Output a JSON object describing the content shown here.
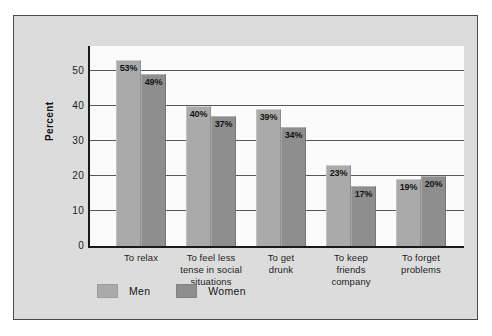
{
  "chart_data": {
    "type": "bar",
    "title": "",
    "subtitle": "",
    "xlabel": "",
    "ylabel": "Percent",
    "ylim": [
      0,
      57
    ],
    "yticks": [
      0,
      10,
      20,
      30,
      40,
      50
    ],
    "ytick_labels": [
      "0",
      "10",
      "20",
      "30",
      "40",
      "50"
    ],
    "grid": true,
    "legend_position": "bottom-left",
    "categories": [
      "To relax",
      "To feel less tense in social situations",
      "To get drunk",
      "To keep friends company",
      "To forget problems"
    ],
    "category_lines": [
      [
        "To relax"
      ],
      [
        "To feel less",
        "tense in social",
        "situations"
      ],
      [
        "To get",
        "drunk"
      ],
      [
        "To keep",
        "friends",
        "company"
      ],
      [
        "To forget",
        "problems"
      ]
    ],
    "series": [
      {
        "name": "Men",
        "color": "#aaaaaa",
        "values": [
          53,
          40,
          39,
          23,
          19
        ],
        "labels": [
          "53%",
          "40%",
          "39%",
          "23%",
          "19%"
        ]
      },
      {
        "name": "Women",
        "color": "#8e8e8e",
        "values": [
          49,
          37,
          34,
          17,
          20
        ],
        "labels": [
          "49%",
          "37%",
          "34%",
          "17%",
          "20%"
        ]
      }
    ]
  },
  "legend": {
    "items": [
      {
        "label": "Men",
        "color": "#aaaaaa"
      },
      {
        "label": "Women",
        "color": "#8e8e8e"
      }
    ]
  },
  "colors": {
    "panel_background": "#dcdcdc",
    "panel_border": "#4a4a4a",
    "plot_background": "#fbfbfb",
    "axis": "#1a1a1a",
    "gridline": "#55595c",
    "men_bar": "#aaaaaa",
    "women_bar": "#8e8e8e",
    "text": "#1c1c1c"
  }
}
